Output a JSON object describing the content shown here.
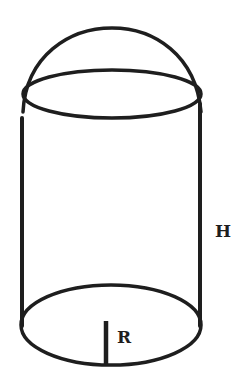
{
  "diagram": {
    "labels": {
      "height": "H",
      "radius": "R"
    },
    "colors": {
      "stroke": "#1e1e1e",
      "background": "#ffffff"
    }
  }
}
